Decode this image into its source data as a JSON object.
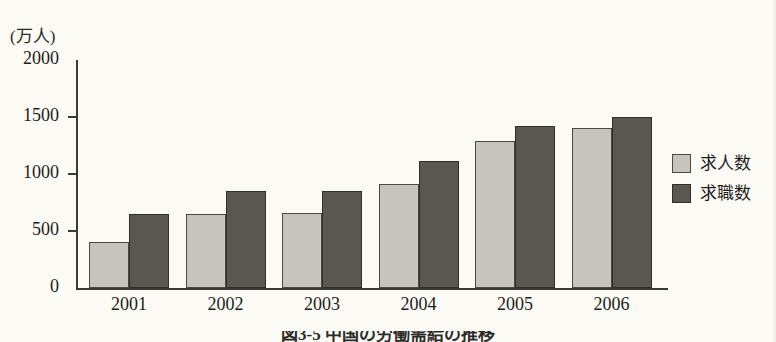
{
  "chart_data": {
    "type": "bar",
    "title": "",
    "caption": "図3-5 中国の労働需給の推移",
    "xlabel": "",
    "ylabel": "",
    "yunit": "(万人)",
    "categories": [
      "2001",
      "2002",
      "2003",
      "2004",
      "2005",
      "2006"
    ],
    "series": [
      {
        "name": "求人数",
        "color": "#c6c5bd",
        "values": [
          400,
          650,
          660,
          910,
          1290,
          1400
        ]
      },
      {
        "name": "求職数",
        "color": "#585750",
        "values": [
          650,
          850,
          850,
          1110,
          1420,
          1500
        ]
      }
    ],
    "ylim": [
      0,
      2000
    ],
    "yticks": [
      0,
      500,
      1000,
      1500,
      2000
    ],
    "ytick_labels": [
      "0",
      "500",
      "1000",
      "1500",
      "2000"
    ],
    "grid": false,
    "legend_position": "right"
  },
  "legend": {
    "entries": [
      {
        "label": "求人数",
        "swatch": "light-gray-swatch"
      },
      {
        "label": "求職数",
        "swatch": "dark-gray-swatch"
      }
    ]
  }
}
